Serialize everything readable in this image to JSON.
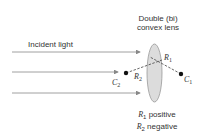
{
  "title": {
    "line1": "Double (bi)",
    "line2": "convex lens"
  },
  "incident_label": "Incident light",
  "points": {
    "c1": {
      "sym": "C",
      "sub": "1"
    },
    "c2": {
      "sym": "C",
      "sub": "2"
    }
  },
  "radii": {
    "r1": {
      "sym": "R",
      "sub": "1"
    },
    "r2": {
      "sym": "R",
      "sub": "2"
    }
  },
  "caption": {
    "line1": {
      "sym": "R",
      "sub": "1",
      "text": " positive"
    },
    "line2": {
      "sym": "R",
      "sub": "2",
      "text": " negative"
    }
  },
  "colors": {
    "lens_fill": "#dcdcdc",
    "line": "#888888",
    "dot": "#111111"
  }
}
